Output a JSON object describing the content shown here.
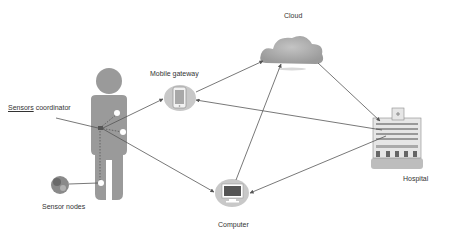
{
  "diagram": {
    "title": "",
    "nodes": [
      {
        "id": "sensors-coordinator",
        "label_underlined": "Sensors",
        "label_rest": " coordinator"
      },
      {
        "id": "mobile-gateway",
        "label": "Mobile gateway"
      },
      {
        "id": "cloud",
        "label": "Cloud"
      },
      {
        "id": "hospital",
        "label": "Hospital"
      },
      {
        "id": "computer",
        "label": "Computer"
      },
      {
        "id": "sensor-nodes",
        "label": "Sensor nodes"
      }
    ],
    "edges": [
      {
        "from": "sensors-coordinator",
        "to": "mobile-gateway",
        "arrow": "end"
      },
      {
        "from": "sensors-coordinator",
        "to": "computer",
        "arrow": "end"
      },
      {
        "from": "mobile-gateway",
        "to": "cloud",
        "arrow": "end"
      },
      {
        "from": "hospital",
        "to": "mobile-gateway",
        "arrow": "end"
      },
      {
        "from": "cloud",
        "to": "hospital",
        "arrow": "end"
      },
      {
        "from": "computer",
        "to": "cloud",
        "arrow": "end"
      },
      {
        "from": "hospital",
        "to": "computer",
        "arrow": "end"
      }
    ],
    "colors": {
      "figure": "#9a9a9a",
      "node_circle": "#c8c8c8",
      "line": "#555555",
      "text": "#333333"
    }
  }
}
